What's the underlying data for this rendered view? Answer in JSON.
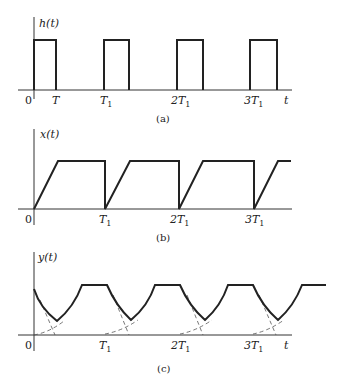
{
  "figure": {
    "panels": [
      {
        "id": "a",
        "caption": "(a)",
        "ylabel": "h(t)",
        "xlabel": "t",
        "origin": "0",
        "ticks": [
          {
            "main": "T",
            "sub": ""
          },
          {
            "main": "T",
            "sub": "1"
          },
          {
            "main": "2T",
            "sub": "1"
          },
          {
            "main": "3T",
            "sub": "1"
          }
        ],
        "description": "Periodic rectangular pulse train of width T and period T1"
      },
      {
        "id": "b",
        "caption": "(b)",
        "ylabel": "x(t)",
        "xlabel": "",
        "origin": "0",
        "ticks": [
          {
            "main": "T",
            "sub": "1"
          },
          {
            "main": "2T",
            "sub": "1"
          },
          {
            "main": "3T",
            "sub": "1"
          }
        ],
        "description": "Periodic waveform: linear ramp up, flat top, then drop to zero at each multiple of T1"
      },
      {
        "id": "c",
        "caption": "(c)",
        "ylabel": "y(t)",
        "xlabel": "t",
        "origin": "0",
        "ticks": [
          {
            "main": "T",
            "sub": "1"
          },
          {
            "main": "2T",
            "sub": "1"
          },
          {
            "main": "3T",
            "sub": "1"
          }
        ],
        "description": "Output waveform: exponential decay and rise segments with flat tops; dashed construction curves near each multiple of T1"
      }
    ]
  }
}
